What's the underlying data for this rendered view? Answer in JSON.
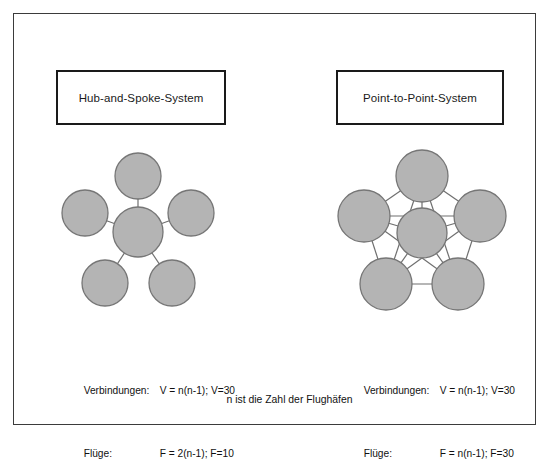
{
  "page": {
    "background_color": "#ffffff",
    "frame_color": "#3b3b3b"
  },
  "colors": {
    "node_fill": "#b4b4b4",
    "node_stroke": "#767676",
    "edge_stroke": "#6f6f6f",
    "box_border": "#1a1a1a",
    "text": "#111111"
  },
  "panels": {
    "left": {
      "title": "Hub-and-Spoke-System",
      "diagram_type": "star",
      "formula": {
        "row1_label": "Verbindungen:",
        "row1_value": "V = n(n-1); V=30",
        "row2_label": "Flüge:",
        "row2_value": "F = 2(n-1); F=10"
      }
    },
    "right": {
      "title": "Point-to-Point-System",
      "diagram_type": "full-mesh",
      "formula": {
        "row1_label": "Verbindungen:",
        "row1_value": "V = n(n-1); V=30",
        "row2_label": "Flüge:",
        "row2_value": "F = n(n-1); F=30"
      }
    }
  },
  "footnote": "n ist die Zahl der Flughäfen",
  "chart_data": {
    "type": "diagram",
    "caption": "n ist die Zahl der Flughäfen",
    "node_count": 6,
    "airports_n": 6,
    "diagrams": [
      {
        "name": "Hub-and-Spoke-System",
        "topology": "star",
        "nodes": [
          {
            "id": "hub",
            "cx": 86,
            "cy": 90,
            "r": 25,
            "role": "hub"
          },
          {
            "id": "n1",
            "cx": 86,
            "cy": 34,
            "r": 23,
            "role": "spoke"
          },
          {
            "id": "n2",
            "cx": 33,
            "cy": 71,
            "r": 23,
            "role": "spoke"
          },
          {
            "id": "n3",
            "cx": 139,
            "cy": 71,
            "r": 23,
            "role": "spoke"
          },
          {
            "id": "n4",
            "cx": 53,
            "cy": 141,
            "r": 23,
            "role": "spoke"
          },
          {
            "id": "n5",
            "cx": 120,
            "cy": 141,
            "r": 23,
            "role": "spoke"
          }
        ],
        "edges": [
          [
            "hub",
            "n1"
          ],
          [
            "hub",
            "n2"
          ],
          [
            "hub",
            "n3"
          ],
          [
            "hub",
            "n4"
          ],
          [
            "hub",
            "n5"
          ]
        ],
        "edge_count": 5,
        "connections_formula": "V = n(n-1); V=30",
        "flights_formula": "F = 2(n-1); F=10",
        "connections_value": 30,
        "flights_value": 10
      },
      {
        "name": "Point-to-Point-System",
        "topology": "full-mesh",
        "nodes": [
          {
            "id": "c",
            "cx": 90,
            "cy": 91,
            "r": 25,
            "role": "center"
          },
          {
            "id": "p1",
            "cx": 90,
            "cy": 34,
            "r": 26,
            "role": "point"
          },
          {
            "id": "p2",
            "cx": 32,
            "cy": 74,
            "r": 26,
            "role": "point"
          },
          {
            "id": "p3",
            "cx": 148,
            "cy": 74,
            "r": 26,
            "role": "point"
          },
          {
            "id": "p4",
            "cx": 54,
            "cy": 142,
            "r": 26,
            "role": "point"
          },
          {
            "id": "p5",
            "cx": 126,
            "cy": 142,
            "r": 26,
            "role": "point"
          }
        ],
        "edges": [
          [
            "p1",
            "p2"
          ],
          [
            "p1",
            "p3"
          ],
          [
            "p1",
            "p4"
          ],
          [
            "p1",
            "p5"
          ],
          [
            "p1",
            "c"
          ],
          [
            "p2",
            "p3"
          ],
          [
            "p2",
            "p4"
          ],
          [
            "p2",
            "p5"
          ],
          [
            "p2",
            "c"
          ],
          [
            "p3",
            "p4"
          ],
          [
            "p3",
            "p5"
          ],
          [
            "p3",
            "c"
          ],
          [
            "p4",
            "p5"
          ],
          [
            "p4",
            "c"
          ],
          [
            "p5",
            "c"
          ]
        ],
        "edge_count": 15,
        "connections_formula": "V = n(n-1); V=30",
        "flights_formula": "F = n(n-1); F=30",
        "connections_value": 30,
        "flights_value": 30
      }
    ]
  }
}
